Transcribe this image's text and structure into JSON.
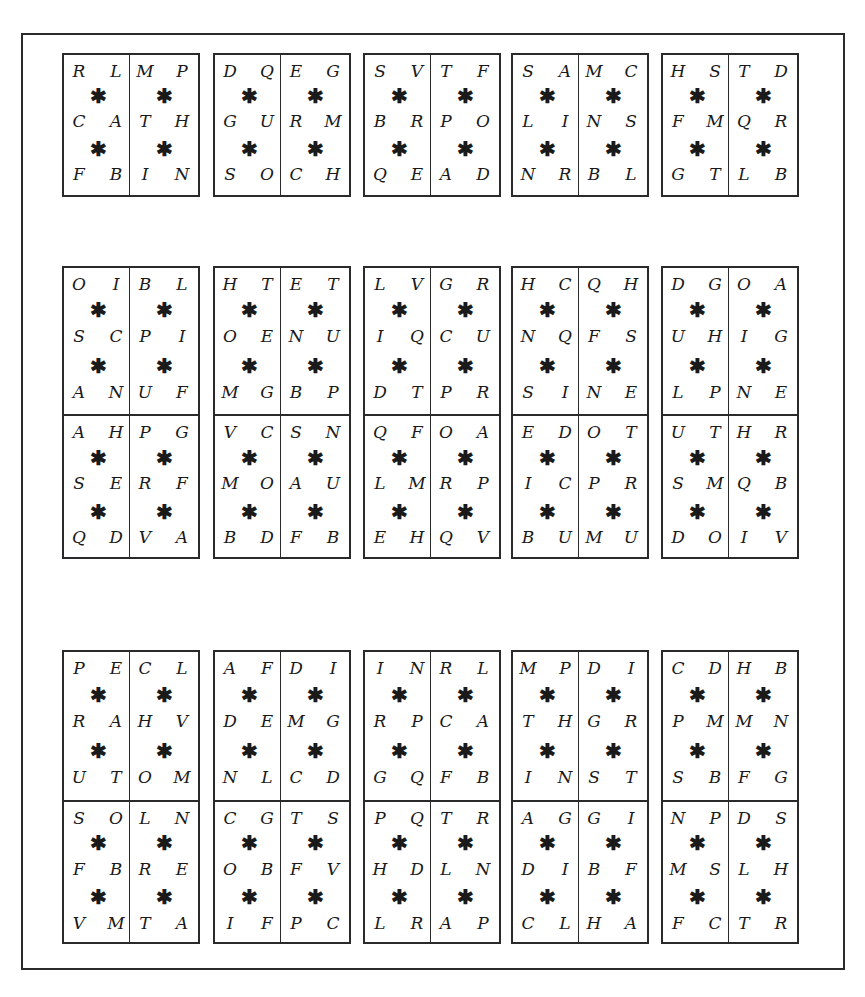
{
  "star_glyph": "✱",
  "rows": [
    {
      "kind": "single",
      "cards": [
        {
          "left": [
            [
              "R",
              "L"
            ],
            [
              "C",
              "A"
            ],
            [
              "F",
              "B"
            ]
          ],
          "right": [
            [
              "M",
              "P"
            ],
            [
              "T",
              "H"
            ],
            [
              "I",
              "N"
            ]
          ]
        },
        {
          "left": [
            [
              "D",
              "Q"
            ],
            [
              "G",
              "U"
            ],
            [
              "S",
              "O"
            ]
          ],
          "right": [
            [
              "E",
              "G"
            ],
            [
              "R",
              "M"
            ],
            [
              "C",
              "H"
            ]
          ]
        },
        {
          "left": [
            [
              "S",
              "V"
            ],
            [
              "B",
              "R"
            ],
            [
              "Q",
              "E"
            ]
          ],
          "right": [
            [
              "T",
              "F"
            ],
            [
              "P",
              "O"
            ],
            [
              "A",
              "D"
            ]
          ]
        },
        {
          "left": [
            [
              "S",
              "A"
            ],
            [
              "L",
              "I"
            ],
            [
              "N",
              "R"
            ]
          ],
          "right": [
            [
              "M",
              "C"
            ],
            [
              "N",
              "S"
            ],
            [
              "B",
              "L"
            ]
          ]
        },
        {
          "left": [
            [
              "H",
              "S"
            ],
            [
              "F",
              "M"
            ],
            [
              "G",
              "T"
            ]
          ],
          "right": [
            [
              "T",
              "D"
            ],
            [
              "Q",
              "R"
            ],
            [
              "L",
              "B"
            ]
          ]
        }
      ]
    },
    {
      "kind": "double",
      "cards": [
        {
          "top": {
            "left": [
              [
                "O",
                "I"
              ],
              [
                "S",
                "C"
              ],
              [
                "A",
                "N"
              ]
            ],
            "right": [
              [
                "B",
                "L"
              ],
              [
                "P",
                "I"
              ],
              [
                "U",
                "F"
              ]
            ]
          },
          "bottom": {
            "left": [
              [
                "A",
                "H"
              ],
              [
                "S",
                "E"
              ],
              [
                "Q",
                "D"
              ]
            ],
            "right": [
              [
                "P",
                "G"
              ],
              [
                "R",
                "F"
              ],
              [
                "V",
                "A"
              ]
            ]
          }
        },
        {
          "top": {
            "left": [
              [
                "H",
                "T"
              ],
              [
                "O",
                "E"
              ],
              [
                "M",
                "G"
              ]
            ],
            "right": [
              [
                "E",
                "T"
              ],
              [
                "N",
                "U"
              ],
              [
                "B",
                "P"
              ]
            ]
          },
          "bottom": {
            "left": [
              [
                "V",
                "C"
              ],
              [
                "M",
                "O"
              ],
              [
                "B",
                "D"
              ]
            ],
            "right": [
              [
                "S",
                "N"
              ],
              [
                "A",
                "U"
              ],
              [
                "F",
                "B"
              ]
            ]
          }
        },
        {
          "top": {
            "left": [
              [
                "L",
                "V"
              ],
              [
                "I",
                "Q"
              ],
              [
                "D",
                "T"
              ]
            ],
            "right": [
              [
                "G",
                "R"
              ],
              [
                "C",
                "U"
              ],
              [
                "P",
                "R"
              ]
            ]
          },
          "bottom": {
            "left": [
              [
                "Q",
                "F"
              ],
              [
                "L",
                "M"
              ],
              [
                "E",
                "H"
              ]
            ],
            "right": [
              [
                "O",
                "A"
              ],
              [
                "R",
                "P"
              ],
              [
                "Q",
                "V"
              ]
            ]
          }
        },
        {
          "top": {
            "left": [
              [
                "H",
                "C"
              ],
              [
                "N",
                "Q"
              ],
              [
                "S",
                "I"
              ]
            ],
            "right": [
              [
                "Q",
                "H"
              ],
              [
                "F",
                "S"
              ],
              [
                "N",
                "E"
              ]
            ]
          },
          "bottom": {
            "left": [
              [
                "E",
                "D"
              ],
              [
                "I",
                "C"
              ],
              [
                "B",
                "U"
              ]
            ],
            "right": [
              [
                "O",
                "T"
              ],
              [
                "P",
                "R"
              ],
              [
                "M",
                "U"
              ]
            ]
          }
        },
        {
          "top": {
            "left": [
              [
                "D",
                "G"
              ],
              [
                "U",
                "H"
              ],
              [
                "L",
                "P"
              ]
            ],
            "right": [
              [
                "O",
                "A"
              ],
              [
                "I",
                "G"
              ],
              [
                "N",
                "E"
              ]
            ]
          },
          "bottom": {
            "left": [
              [
                "U",
                "T"
              ],
              [
                "S",
                "M"
              ],
              [
                "D",
                "O"
              ]
            ],
            "right": [
              [
                "H",
                "R"
              ],
              [
                "Q",
                "B"
              ],
              [
                "I",
                "V"
              ]
            ]
          }
        }
      ]
    },
    {
      "kind": "double",
      "cards": [
        {
          "top": {
            "left": [
              [
                "P",
                "E"
              ],
              [
                "R",
                "A"
              ],
              [
                "U",
                "T"
              ]
            ],
            "right": [
              [
                "C",
                "L"
              ],
              [
                "H",
                "V"
              ],
              [
                "O",
                "M"
              ]
            ]
          },
          "bottom": {
            "left": [
              [
                "S",
                "O"
              ],
              [
                "F",
                "B"
              ],
              [
                "V",
                "M"
              ]
            ],
            "right": [
              [
                "L",
                "N"
              ],
              [
                "R",
                "E"
              ],
              [
                "T",
                "A"
              ]
            ]
          }
        },
        {
          "top": {
            "left": [
              [
                "A",
                "F"
              ],
              [
                "D",
                "E"
              ],
              [
                "N",
                "L"
              ]
            ],
            "right": [
              [
                "D",
                "I"
              ],
              [
                "M",
                "G"
              ],
              [
                "C",
                "D"
              ]
            ]
          },
          "bottom": {
            "left": [
              [
                "C",
                "G"
              ],
              [
                "O",
                "B"
              ],
              [
                "I",
                "F"
              ]
            ],
            "right": [
              [
                "T",
                "S"
              ],
              [
                "F",
                "V"
              ],
              [
                "P",
                "C"
              ]
            ]
          }
        },
        {
          "top": {
            "left": [
              [
                "I",
                "N"
              ],
              [
                "R",
                "P"
              ],
              [
                "G",
                "Q"
              ]
            ],
            "right": [
              [
                "R",
                "L"
              ],
              [
                "C",
                "A"
              ],
              [
                "F",
                "B"
              ]
            ]
          },
          "bottom": {
            "left": [
              [
                "P",
                "Q"
              ],
              [
                "H",
                "D"
              ],
              [
                "L",
                "R"
              ]
            ],
            "right": [
              [
                "T",
                "R"
              ],
              [
                "L",
                "N"
              ],
              [
                "A",
                "P"
              ]
            ]
          }
        },
        {
          "top": {
            "left": [
              [
                "M",
                "P"
              ],
              [
                "T",
                "H"
              ],
              [
                "I",
                "N"
              ]
            ],
            "right": [
              [
                "D",
                "I"
              ],
              [
                "G",
                "R"
              ],
              [
                "S",
                "T"
              ]
            ]
          },
          "bottom": {
            "left": [
              [
                "A",
                "G"
              ],
              [
                "D",
                "I"
              ],
              [
                "C",
                "L"
              ]
            ],
            "right": [
              [
                "G",
                "I"
              ],
              [
                "B",
                "F"
              ],
              [
                "H",
                "A"
              ]
            ]
          }
        },
        {
          "top": {
            "left": [
              [
                "C",
                "D"
              ],
              [
                "P",
                "M"
              ],
              [
                "S",
                "B"
              ]
            ],
            "right": [
              [
                "H",
                "B"
              ],
              [
                "M",
                "N"
              ],
              [
                "F",
                "G"
              ]
            ]
          },
          "bottom": {
            "left": [
              [
                "N",
                "P"
              ],
              [
                "M",
                "S"
              ],
              [
                "F",
                "C"
              ]
            ],
            "right": [
              [
                "D",
                "S"
              ],
              [
                "L",
                "H"
              ],
              [
                "T",
                "R"
              ]
            ]
          }
        }
      ]
    }
  ]
}
